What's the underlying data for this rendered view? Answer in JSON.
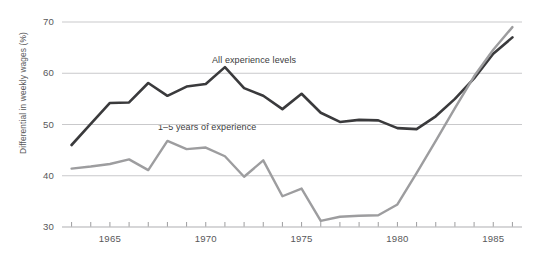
{
  "chart_data": {
    "type": "line",
    "title": "",
    "subtitle": "",
    "xlabel": "",
    "ylabel": "Differential in weekly wages (%)",
    "xlim": [
      1962.5,
      1986.5
    ],
    "ylim": [
      30,
      70
    ],
    "yticks": [
      30,
      40,
      50,
      60,
      70
    ],
    "xticks": [
      1963,
      1964,
      1965,
      1966,
      1967,
      1968,
      1969,
      1970,
      1971,
      1972,
      1973,
      1974,
      1975,
      1976,
      1977,
      1978,
      1979,
      1980,
      1981,
      1982,
      1983,
      1984,
      1985,
      1986
    ],
    "xtick_labels": [
      "1965",
      "1970",
      "1975",
      "1980",
      "1985"
    ],
    "xtick_label_values": [
      1965,
      1970,
      1975,
      1980,
      1985
    ],
    "grid": "horizontal",
    "legend": "inline-annotations",
    "x": [
      1963,
      1964,
      1965,
      1966,
      1967,
      1968,
      1969,
      1970,
      1971,
      1972,
      1973,
      1974,
      1975,
      1976,
      1977,
      1978,
      1979,
      1980,
      1981,
      1982,
      1983,
      1984,
      1985,
      1986
    ],
    "series": [
      {
        "name": "All experience levels",
        "color": "#3a3a3c",
        "values": [
          46.0,
          50.1,
          54.2,
          54.3,
          58.1,
          55.6,
          57.4,
          57.9,
          61.2,
          57.1,
          55.6,
          53.0,
          56.0,
          52.3,
          50.5,
          50.9,
          50.8,
          49.3,
          49.1,
          51.6,
          55.0,
          59.0,
          63.8,
          67.0
        ]
      },
      {
        "name": "1–5 years of experience",
        "color": "#9d9d9f",
        "values": [
          41.4,
          41.8,
          42.3,
          43.2,
          41.1,
          46.8,
          45.2,
          45.5,
          43.8,
          39.8,
          43.0,
          36.0,
          37.5,
          31.2,
          32.0,
          32.2,
          32.3,
          34.4,
          40.5,
          46.8,
          53.2,
          59.4,
          64.6,
          69.0
        ]
      }
    ],
    "annotations": [
      {
        "text": "All experience levels",
        "x_px": 212,
        "y_px": 55
      },
      {
        "text": "1–5 years of experience",
        "x_px": 158,
        "y_px": 122
      }
    ]
  },
  "axis": {
    "y_tick_labels": [
      "70",
      "60",
      "50",
      "40",
      "30"
    ],
    "x_tick_labels": [
      "1965",
      "1970",
      "1975",
      "1980",
      "1985"
    ],
    "y_axis_title": "Differential in weekly wages (%)"
  },
  "colors": {
    "background": "#ffffff",
    "grid": "#c9c9cb",
    "axis_text": "#58585a",
    "series_dark": "#3a3a3c",
    "series_light": "#9d9d9f"
  }
}
